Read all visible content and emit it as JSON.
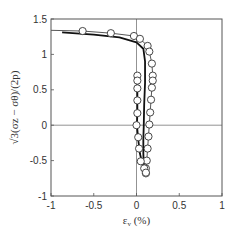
{
  "chart_data": {
    "type": "scatter",
    "title": "",
    "xlabel": "ε_v (%)",
    "ylabel": "√3(σ_z − σ_θ)/(2p)",
    "xlim": [
      -1,
      1
    ],
    "ylim": [
      -1,
      1.5
    ],
    "xticks": [
      -1,
      -0.5,
      0,
      0.5,
      1
    ],
    "yticks": [
      -1,
      -0.5,
      0,
      0.5,
      1,
      1.5
    ],
    "xtick_labels": [
      "-1",
      "-0.5",
      "0",
      "0.5",
      "1"
    ],
    "ytick_labels": [
      "-1",
      "-0.5",
      "0",
      "0.5",
      "1",
      "1.5"
    ],
    "grid": false,
    "zero_lines": true,
    "legend": null,
    "series": [
      {
        "name": "experiment (circles, outer branch)",
        "marker": "open-circle",
        "x": [
          -0.63,
          -0.3,
          -0.03,
          0.04,
          0.13,
          0.15,
          0.18,
          0.19,
          0.19,
          0.18,
          0.17,
          0.16,
          0.15,
          0.14,
          0.13,
          0.12,
          0.11,
          0.11
        ],
        "y": [
          1.33,
          1.3,
          1.26,
          1.22,
          1.12,
          1.04,
          0.87,
          0.7,
          0.63,
          0.53,
          0.36,
          0.18,
          0.01,
          -0.16,
          -0.33,
          -0.5,
          -0.61,
          -0.68
        ]
      },
      {
        "name": "experiment (circles, inner branch)",
        "marker": "open-circle",
        "x": [
          0.01,
          0.01,
          0.01,
          0.01,
          0.01,
          0.0,
          0.02,
          0.03,
          0.05,
          0.09,
          0.11
        ],
        "y": [
          0.7,
          0.63,
          0.52,
          0.35,
          0.17,
          0.0,
          -0.17,
          -0.33,
          -0.51,
          -0.61,
          -0.67
        ]
      },
      {
        "name": "simulation (thin line)",
        "marker": "none",
        "line": "thin",
        "x": [
          -1.0,
          -0.63,
          -0.3,
          -0.03,
          0.04,
          0.13,
          0.15,
          0.18,
          0.19,
          0.19,
          0.18,
          0.17,
          0.16,
          0.15,
          0.14,
          0.13,
          0.12,
          0.11
        ],
        "y": [
          1.34,
          1.33,
          1.3,
          1.26,
          1.22,
          1.12,
          1.04,
          0.87,
          0.7,
          0.63,
          0.53,
          0.36,
          0.18,
          0.01,
          -0.16,
          -0.33,
          -0.5,
          -0.68
        ]
      },
      {
        "name": "simulation (thick line)",
        "marker": "none",
        "line": "thick",
        "x": [
          -0.87,
          -0.5,
          -0.2,
          0.0,
          0.08,
          0.1,
          0.1,
          0.09,
          0.085,
          0.08,
          0.08,
          0.085,
          0.09
        ],
        "y": [
          1.31,
          1.28,
          1.24,
          1.17,
          1.08,
          0.9,
          0.6,
          0.3,
          0.0,
          -0.2,
          -0.4,
          -0.55,
          -0.62
        ]
      },
      {
        "name": "inner branch line (thick dark)",
        "marker": "none",
        "line": "thick",
        "x": [
          0.01,
          0.01,
          0.01,
          0.005,
          0.02,
          0.04,
          0.07,
          0.1
        ],
        "y": [
          0.65,
          0.35,
          0.17,
          0.0,
          -0.2,
          -0.4,
          -0.55,
          -0.64
        ]
      }
    ]
  },
  "axes": {
    "x_label_main": "ε",
    "x_label_sub": "v",
    "x_label_unit": " (%)",
    "y_label": "√3(σz − σθ)/(2p)"
  }
}
